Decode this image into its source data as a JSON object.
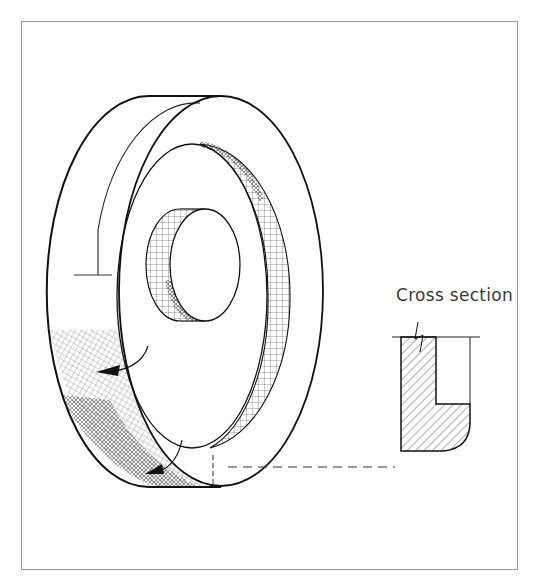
{
  "figure": {
    "labels": {
      "cross_section": "Cross section"
    },
    "colors": {
      "frame": "#9a9a9a",
      "line": "#1a1a1a",
      "hatch": "#2a2a2a",
      "text": "#3a3a3a",
      "background": "#ffffff"
    },
    "elements": [
      {
        "name": "wheel-outer-rim",
        "description": "outer rim of wheel in isometric view"
      },
      {
        "name": "wheel-front-face",
        "description": "front face ring"
      },
      {
        "name": "recess-bore",
        "description": "cross-hatched recessed inner bore band"
      },
      {
        "name": "hub",
        "description": "central hub cylinder with hatched side"
      },
      {
        "name": "rotation-arrows",
        "description": "two curved arrows showing rotation direction on rim"
      },
      {
        "name": "projection-line",
        "description": "dashed line linking wheel to cross section"
      },
      {
        "name": "cross-section",
        "description": "hatched L-shaped cross section with break mark and rounded outer corner"
      }
    ]
  }
}
